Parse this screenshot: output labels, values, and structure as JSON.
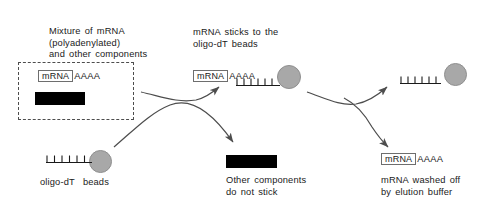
{
  "figure": {
    "background_color": "#ffffff",
    "bead_color": "#a8a8a8",
    "bar_color": "#000000",
    "line_color": "#4d4d4d"
  },
  "captions": {
    "mixture_line1": "Mixture of mRNA",
    "mixture_line2": "(polyadenylated)",
    "mixture_line3": "and other components",
    "sticks_line1": "mRNA sticks to the",
    "sticks_line2": "oligo-dT beads",
    "beads_label": "oligo-dT  beads",
    "other_line1": "Other components",
    "other_line2": "do not stick",
    "washed_line1": "mRNA washed off",
    "washed_line2": "by elution buffer"
  },
  "molecules": {
    "mrna_label": "mRNA",
    "poly_a_tail": "AAAA",
    "poly_t_tail": "TTTTTT"
  },
  "elements": {
    "mixture_box_name": "mixture-dashed-container",
    "input_mrna_name": "input-mrna-molecule",
    "input_contaminant_name": "input-other-components-bar",
    "oligo_bead_name": "oligo-dt-bead-start",
    "bound_mrna_name": "bound-mrna-molecule",
    "bound_bead_name": "oligo-dt-bead-bound",
    "waste_bar_name": "unbound-other-components-bar",
    "eluted_bead_name": "oligo-dt-bead-eluted",
    "eluted_mrna_name": "eluted-mrna-molecule"
  }
}
